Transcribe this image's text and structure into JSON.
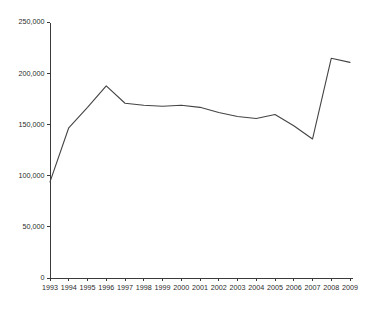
{
  "chart_data": {
    "type": "line",
    "title": "",
    "subtitle": "",
    "xlabel": "",
    "ylabel": "",
    "grid": false,
    "legend": false,
    "legend_position": "none",
    "xlim": [
      1993,
      2009
    ],
    "ylim": [
      0,
      250000
    ],
    "x": [
      1993,
      1994,
      1995,
      1996,
      1997,
      1998,
      1999,
      2000,
      2001,
      2002,
      2003,
      2004,
      2005,
      2006,
      2007,
      2008,
      2009
    ],
    "categories": [
      "1993",
      "1994",
      "1995",
      "1996",
      "1997",
      "1998",
      "1999",
      "2000",
      "2001",
      "2002",
      "2003",
      "2004",
      "2005",
      "2006",
      "2007",
      "2008",
      "2009"
    ],
    "values": [
      94000,
      147000,
      167000,
      188000,
      171000,
      169000,
      168000,
      169000,
      167000,
      162000,
      158000,
      156000,
      160000,
      149000,
      136000,
      215000,
      211000
    ],
    "series": [
      {
        "name": "series-1",
        "color": "#444444",
        "values": [
          94000,
          147000,
          167000,
          188000,
          171000,
          169000,
          168000,
          169000,
          167000,
          162000,
          158000,
          156000,
          160000,
          149000,
          136000,
          215000,
          211000
        ]
      }
    ],
    "y_ticks": [
      0,
      50000,
      100000,
      150000,
      200000,
      250000
    ],
    "y_tick_labels": [
      "0",
      "50,000",
      "100,000",
      "150,000",
      "200,000",
      "250,000"
    ],
    "x_tick_labels": [
      "1993",
      "1994",
      "1995",
      "1996",
      "1997",
      "1998",
      "1999",
      "2000",
      "2001",
      "2002",
      "2003",
      "2004",
      "2005",
      "2006",
      "2007",
      "2008",
      "2009"
    ],
    "axis_color": "#3a3a3a",
    "background_color": "#ffffff"
  }
}
